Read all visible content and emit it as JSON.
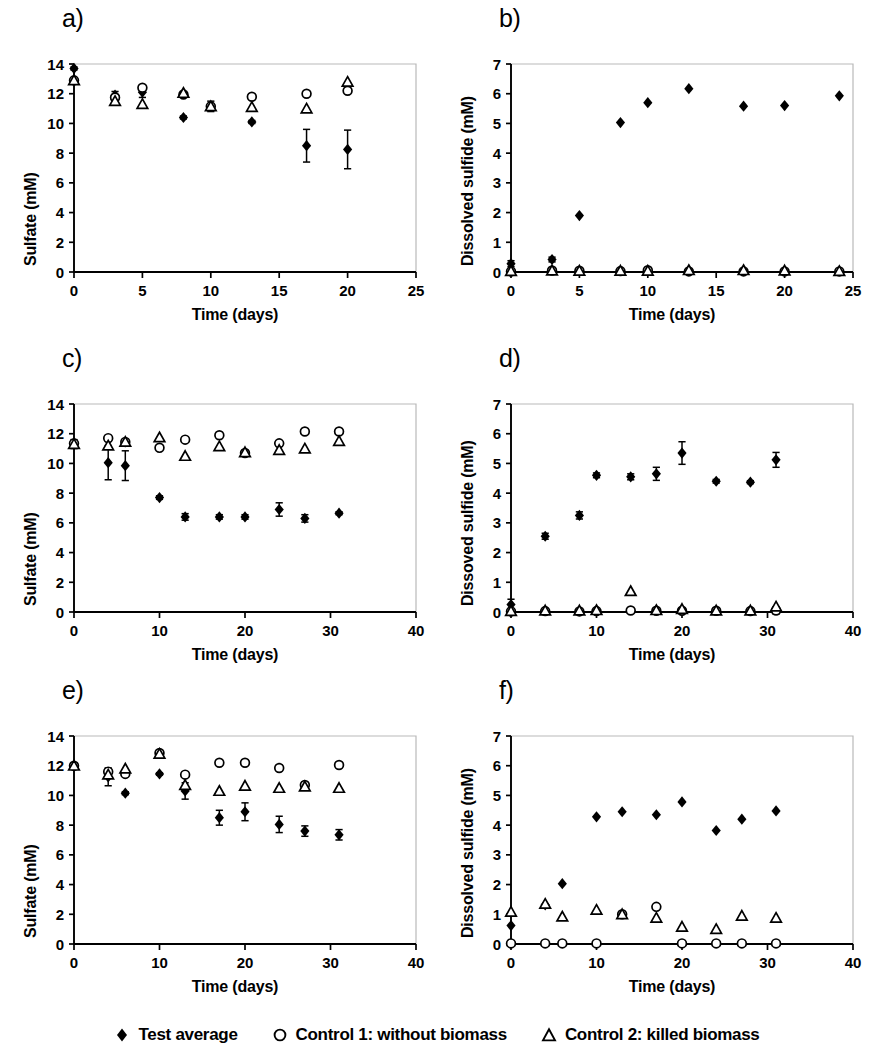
{
  "figure": {
    "panels_count": 6
  },
  "legend": {
    "items": [
      {
        "marker": "filled-diamond-icon",
        "label": "Test average"
      },
      {
        "marker": "open-circle-icon",
        "label": "Control 1: without biomass"
      },
      {
        "marker": "open-triangle-icon",
        "label": "Control 2: killed biomass"
      }
    ]
  },
  "chart_data": [
    {
      "id": "a",
      "panel_label": "a)",
      "type": "scatter",
      "title": "",
      "xlabel": "Time (days)",
      "ylabel": "Sulfate (mM)",
      "xlim": [
        0,
        25
      ],
      "ylim": [
        0,
        14
      ],
      "xticks": [
        0,
        5,
        10,
        15,
        20,
        25
      ],
      "yticks": [
        0,
        2,
        4,
        6,
        8,
        10,
        12,
        14
      ],
      "grid": false,
      "legend_position": "below-figure",
      "series": [
        {
          "name": "Test average",
          "marker": "filled-diamond",
          "x": [
            0,
            3,
            5,
            8,
            10,
            13,
            17,
            20
          ],
          "y": [
            13.7,
            11.9,
            12.1,
            10.4,
            11.15,
            10.1,
            8.5,
            8.25
          ],
          "yerr": [
            0.1,
            0.25,
            0.35,
            0.1,
            0.35,
            0.1,
            1.1,
            1.3
          ]
        },
        {
          "name": "Control 1: without biomass",
          "marker": "open-circle",
          "x": [
            0,
            3,
            5,
            8,
            10,
            13,
            17,
            20
          ],
          "y": [
            12.9,
            11.75,
            12.4,
            11.95,
            11.15,
            11.8,
            12.0,
            12.2
          ],
          "yerr": [
            0,
            0,
            0,
            0,
            0,
            0,
            0,
            0
          ]
        },
        {
          "name": "Control 2: killed biomass",
          "marker": "open-triangle",
          "x": [
            0,
            3,
            5,
            8,
            10,
            13,
            17,
            20
          ],
          "y": [
            12.9,
            11.5,
            11.3,
            12.05,
            11.15,
            11.1,
            11.0,
            12.8
          ],
          "yerr": [
            0,
            0,
            0,
            0,
            0,
            0,
            0,
            0
          ]
        }
      ]
    },
    {
      "id": "b",
      "panel_label": "b)",
      "type": "scatter",
      "title": "",
      "xlabel": "Time (days)",
      "ylabel": "Dissolved sulfide (mM)",
      "xlim": [
        0,
        25
      ],
      "ylim": [
        0,
        7
      ],
      "xticks": [
        0,
        5,
        10,
        15,
        20,
        25
      ],
      "yticks": [
        0,
        1,
        2,
        3,
        4,
        5,
        6,
        7
      ],
      "grid": false,
      "legend_position": "below-figure",
      "series": [
        {
          "name": "Test average",
          "marker": "filled-diamond",
          "x": [
            0,
            3,
            5,
            8,
            10,
            13,
            17,
            20,
            24
          ],
          "y": [
            0.28,
            0.42,
            1.9,
            5.03,
            5.7,
            6.17,
            5.58,
            5.6,
            5.93
          ],
          "yerr": [
            0.1,
            0.08,
            0,
            0,
            0,
            0,
            0,
            0,
            0
          ]
        },
        {
          "name": "Control 1: without biomass",
          "marker": "open-circle",
          "x": [
            0,
            3,
            5,
            8,
            10,
            13,
            17,
            20,
            24
          ],
          "y": [
            0.02,
            0.05,
            0.04,
            0.03,
            0.06,
            0.02,
            0.02,
            0.02,
            0.02
          ],
          "yerr": [
            0,
            0,
            0,
            0,
            0,
            0,
            0,
            0,
            0
          ]
        },
        {
          "name": "Control 2: killed biomass",
          "marker": "open-triangle",
          "x": [
            0,
            3,
            5,
            8,
            10,
            13,
            17,
            20,
            24
          ],
          "y": [
            0.03,
            0.05,
            0.04,
            0.04,
            0.04,
            0.06,
            0.06,
            0.05,
            0.03
          ],
          "yerr": [
            0,
            0,
            0,
            0,
            0,
            0,
            0,
            0,
            0
          ]
        }
      ]
    },
    {
      "id": "c",
      "panel_label": "c)",
      "type": "scatter",
      "title": "",
      "xlabel": "Time (days)",
      "ylabel": "Sulfate (mM)",
      "xlim": [
        0,
        40
      ],
      "ylim": [
        0,
        14
      ],
      "xticks": [
        0,
        10,
        20,
        30,
        40
      ],
      "yticks": [
        0,
        2,
        4,
        6,
        8,
        10,
        12,
        14
      ],
      "grid": false,
      "legend_position": "below-figure",
      "series": [
        {
          "name": "Test average",
          "marker": "filled-diamond",
          "x": [
            0,
            4,
            6,
            10,
            13,
            17,
            20,
            24,
            27,
            31
          ],
          "y": [
            11.3,
            10.05,
            9.85,
            7.7,
            6.4,
            6.4,
            6.4,
            6.9,
            6.3,
            6.65
          ],
          "yerr": [
            0.3,
            1.15,
            1.0,
            0.12,
            0.22,
            0.15,
            0.15,
            0.45,
            0.25,
            0.1
          ]
        },
        {
          "name": "Control 1: without biomass",
          "marker": "open-circle",
          "x": [
            0,
            4,
            6,
            10,
            13,
            17,
            20,
            24,
            27,
            31
          ],
          "y": [
            11.35,
            11.7,
            11.45,
            11.05,
            11.6,
            11.9,
            10.7,
            11.35,
            12.15,
            12.15
          ],
          "yerr": [
            0,
            0,
            0,
            0,
            0,
            0,
            0,
            0,
            0,
            0
          ]
        },
        {
          "name": "Control 2: killed biomass",
          "marker": "open-triangle",
          "x": [
            0,
            4,
            6,
            10,
            13,
            17,
            20,
            24,
            27,
            31
          ],
          "y": [
            11.3,
            11.2,
            11.45,
            11.75,
            10.5,
            11.15,
            10.75,
            10.9,
            11.0,
            11.5
          ],
          "yerr": [
            0,
            0,
            0,
            0,
            0,
            0,
            0,
            0,
            0,
            0
          ]
        }
      ]
    },
    {
      "id": "d",
      "panel_label": "d)",
      "type": "scatter",
      "title": "",
      "xlabel": "Time (days)",
      "ylabel": "Dissoved sulfide (mM)",
      "xlim": [
        0,
        40
      ],
      "ylim": [
        0,
        7
      ],
      "xticks": [
        0,
        10,
        20,
        30,
        40
      ],
      "yticks": [
        0,
        1,
        2,
        3,
        4,
        5,
        6,
        7
      ],
      "grid": false,
      "legend_position": "below-figure",
      "series": [
        {
          "name": "Test average",
          "marker": "filled-diamond",
          "x": [
            0,
            4,
            8,
            10,
            14,
            17,
            20,
            24,
            28,
            31
          ],
          "y": [
            0.25,
            2.55,
            3.25,
            4.6,
            4.55,
            4.65,
            5.35,
            4.4,
            4.37,
            5.12
          ],
          "yerr": [
            0.18,
            0.1,
            0.12,
            0.08,
            0.1,
            0.22,
            0.38,
            0.06,
            0.05,
            0.25
          ]
        },
        {
          "name": "Control 1: without biomass",
          "marker": "open-circle",
          "x": [
            0,
            4,
            8,
            10,
            14,
            17,
            20,
            24,
            28,
            31
          ],
          "y": [
            0.02,
            0.03,
            0.02,
            0.03,
            0.05,
            0.04,
            0.04,
            0.04,
            0.03,
            0.05
          ],
          "yerr": [
            0,
            0,
            0,
            0,
            0,
            0,
            0,
            0,
            0,
            0.12
          ]
        },
        {
          "name": "Control 2: killed biomass",
          "marker": "open-triangle",
          "x": [
            0,
            4,
            8,
            10,
            14,
            17,
            20,
            24,
            28,
            31
          ],
          "y": [
            0.03,
            0.05,
            0.05,
            0.06,
            0.7,
            0.06,
            0.1,
            0.05,
            0.05,
            0.18
          ],
          "yerr": [
            0,
            0,
            0,
            0,
            0,
            0,
            0,
            0,
            0,
            0
          ]
        }
      ]
    },
    {
      "id": "e",
      "panel_label": "e)",
      "type": "scatter",
      "title": "",
      "xlabel": "Time (days)",
      "ylabel": "Sulfate (mM)",
      "xlim": [
        0,
        40
      ],
      "ylim": [
        0,
        14
      ],
      "xticks": [
        0,
        10,
        20,
        30,
        40
      ],
      "yticks": [
        0,
        2,
        4,
        6,
        8,
        10,
        12,
        14
      ],
      "grid": false,
      "legend_position": "below-figure",
      "series": [
        {
          "name": "Test average",
          "marker": "filled-diamond",
          "x": [
            0,
            4,
            6,
            10,
            13,
            17,
            20,
            24,
            27,
            31
          ],
          "y": [
            12.0,
            11.25,
            10.15,
            11.45,
            10.3,
            8.5,
            8.9,
            8.05,
            7.6,
            7.35
          ],
          "yerr": [
            0.1,
            0.6,
            0.1,
            0.08,
            0.55,
            0.5,
            0.6,
            0.55,
            0.35,
            0.35
          ]
        },
        {
          "name": "Control 1: without biomass",
          "marker": "open-circle",
          "x": [
            0,
            4,
            6,
            10,
            13,
            17,
            20,
            24,
            27,
            31
          ],
          "y": [
            12.0,
            11.6,
            11.45,
            12.85,
            11.4,
            12.2,
            12.2,
            11.85,
            10.7,
            12.05
          ],
          "yerr": [
            0,
            0,
            0,
            0,
            0,
            0,
            0,
            0,
            0,
            0
          ]
        },
        {
          "name": "Control 2: killed biomass",
          "marker": "open-triangle",
          "x": [
            0,
            4,
            6,
            10,
            13,
            17,
            20,
            24,
            27,
            31
          ],
          "y": [
            12.0,
            11.4,
            11.8,
            12.8,
            10.7,
            10.3,
            10.65,
            10.5,
            10.6,
            10.5
          ],
          "yerr": [
            0,
            0,
            0,
            0,
            0,
            0,
            0,
            0,
            0,
            0
          ]
        }
      ]
    },
    {
      "id": "f",
      "panel_label": "f)",
      "type": "scatter",
      "title": "",
      "xlabel": "Time (days)",
      "ylabel": "Dissolved sulfide (mM)",
      "xlim": [
        0,
        40
      ],
      "ylim": [
        0,
        7
      ],
      "xticks": [
        0,
        10,
        20,
        30,
        40
      ],
      "yticks": [
        0,
        1,
        2,
        3,
        4,
        5,
        6,
        7
      ],
      "grid": false,
      "legend_position": "below-figure",
      "series": [
        {
          "name": "Test average",
          "marker": "filled-diamond",
          "x": [
            0,
            4,
            6,
            10,
            13,
            17,
            20,
            24,
            27,
            31
          ],
          "y": [
            0.62,
            1.32,
            2.03,
            4.28,
            4.45,
            4.35,
            4.78,
            3.82,
            4.2,
            4.48
          ],
          "yerr": [
            0,
            0,
            0,
            0,
            0,
            0,
            0,
            0,
            0,
            0
          ]
        },
        {
          "name": "Control 1: without biomass",
          "marker": "open-circle",
          "x": [
            0,
            4,
            6,
            10,
            13,
            17,
            20,
            24,
            27,
            31
          ],
          "y": [
            0.02,
            0.02,
            0.02,
            0.02,
            1.0,
            1.25,
            0.02,
            0.02,
            0.02,
            0.02
          ],
          "yerr": [
            0,
            0,
            0,
            0,
            0,
            0,
            0,
            0,
            0,
            0
          ]
        },
        {
          "name": "Control 2: killed biomass",
          "marker": "open-triangle",
          "x": [
            0,
            4,
            6,
            10,
            13,
            17,
            20,
            24,
            27,
            31
          ],
          "y": [
            1.08,
            1.35,
            0.92,
            1.15,
            1.0,
            0.88,
            0.58,
            0.5,
            0.95,
            0.88
          ],
          "yerr": [
            0,
            0,
            0,
            0,
            0,
            0,
            0,
            0,
            0,
            0
          ]
        }
      ]
    }
  ]
}
